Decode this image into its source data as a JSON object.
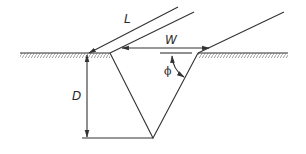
{
  "diagram": {
    "labels": {
      "length": "L",
      "width": "W",
      "depth": "D",
      "angle": "ϕ"
    },
    "colors": {
      "line": "#333333",
      "hatch": "#777777",
      "background": "#ffffff"
    }
  }
}
